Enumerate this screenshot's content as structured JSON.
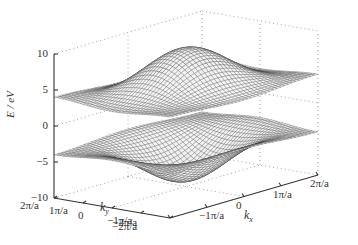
{
  "chart_data": {
    "type": "surface3d",
    "title": "",
    "xlabel": "k_x",
    "ylabel": "k_y",
    "zlabel": "E / eV",
    "xlim": [
      "-2π/a",
      "2π/a"
    ],
    "ylim": [
      "-2π/a",
      "2π/a"
    ],
    "zlim": [
      -10,
      10
    ],
    "x_ticks": [
      "−2π/a",
      "−1π/a",
      "0",
      "1π/a",
      "2π/a"
    ],
    "y_ticks": [
      "2π/a",
      "1π/a",
      "0",
      "−1π/a",
      "−2π/a"
    ],
    "z_ticks": [
      "10",
      "5",
      "0",
      "−5",
      "−10"
    ],
    "z_tick_values": [
      10,
      5,
      0,
      -5,
      -10
    ],
    "grid": "dotted box",
    "series": [
      {
        "name": "upper band",
        "formula": "E = 5 + 2.5*(cos(kx*a/2)... ) approx range 0 to 10",
        "zmin": 0,
        "zmax": 10
      },
      {
        "name": "lower band",
        "formula": "mirror of upper band",
        "zmin": -10,
        "zmax": 0
      }
    ],
    "mesh_color": "#333333"
  },
  "labels": {
    "z_axis": "E / eV",
    "x_axis_k": "k",
    "x_axis_sub": "x",
    "y_axis_k": "k",
    "y_axis_sub": "y"
  }
}
